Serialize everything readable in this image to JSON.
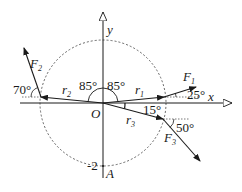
{
  "diagram": {
    "type": "force-vector-diagram",
    "axes": {
      "x_label": "x",
      "y_label": "y",
      "origin_label": "O",
      "point_label": "A",
      "point_value": "-2"
    },
    "circle": {
      "style": "dashed",
      "radius_value": 2
    },
    "position_vectors": [
      {
        "name": "r1",
        "label": "r",
        "subscript": "1",
        "angle_from_y_axis": "85°"
      },
      {
        "name": "r2",
        "label": "r",
        "subscript": "2",
        "angle_from_y_axis": "85°"
      },
      {
        "name": "r3",
        "label": "r",
        "subscript": "3",
        "angle_below_x_axis": "15°"
      }
    ],
    "forces": [
      {
        "name": "F1",
        "label": "F",
        "subscript": "1",
        "angle": "25°"
      },
      {
        "name": "F2",
        "label": "F",
        "subscript": "2",
        "angle": "70°"
      },
      {
        "name": "F3",
        "label": "F",
        "subscript": "3",
        "angle": "50°"
      }
    ],
    "angle_labels": {
      "r2_angle": "85°",
      "r1_angle": "85°",
      "r3_angle": "15°",
      "f1_angle": "25°",
      "f2_angle": "70°",
      "f3_angle": "50°"
    },
    "colors": {
      "stroke": "#1a1a1a",
      "dashed": "#555555",
      "background": "#ffffff"
    }
  }
}
